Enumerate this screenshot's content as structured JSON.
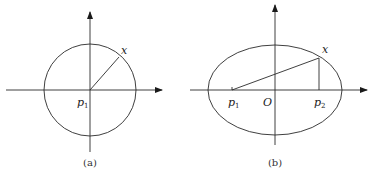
{
  "figures": [
    {
      "id": "a",
      "caption": "(a)",
      "shape": "circle",
      "labels": {
        "point_x": "x",
        "p1_main": "p",
        "p1_sub": "1"
      }
    },
    {
      "id": "b",
      "caption": "(b)",
      "shape": "ellipse",
      "labels": {
        "point_x": "x",
        "p1_main": "p",
        "p1_sub": "1",
        "origin": "O",
        "p2_main": "p",
        "p2_sub": "2"
      }
    }
  ],
  "colors": {
    "stroke": "#2a2a2a",
    "background": "#ffffff"
  }
}
